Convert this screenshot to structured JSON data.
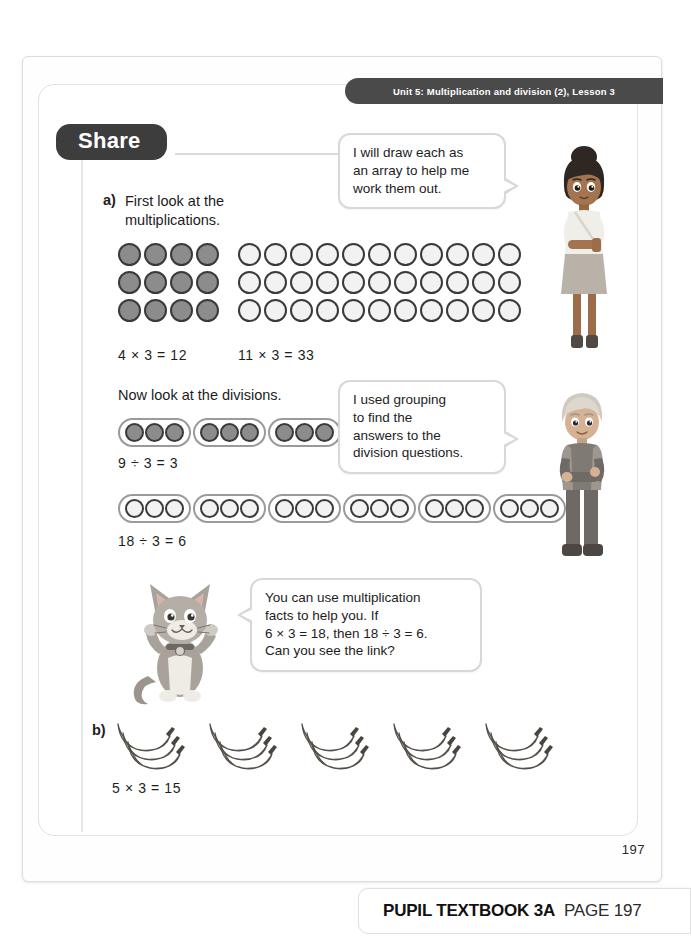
{
  "page": {
    "unit_banner": "Unit 5: Multiplication and division (2), Lesson 3",
    "section_badge": "Share",
    "page_number": "197",
    "footer_book": "PUPIL TEXTBOOK 3A",
    "footer_page": "PAGE 197"
  },
  "colors": {
    "banner_bg": "#4a4a4a",
    "badge_bg": "#3d3d3d",
    "counter_dark": "#8c8c8c",
    "counter_light": "#f2f2f2",
    "counter_outline": "#3a3a3a",
    "frame": "#e2e2e2"
  },
  "part_a": {
    "label": "a)",
    "instruction_line1": "First look at the",
    "instruction_line2": "multiplications.",
    "division_instruction": "Now look at the divisions.",
    "arrays": [
      {
        "name": "four-by-three-array",
        "columns": 4,
        "rows": 3,
        "fill": "dark",
        "equation": "4 × 3 = 12"
      },
      {
        "name": "eleven-by-three-array",
        "columns": 11,
        "rows": 3,
        "fill": "light",
        "equation": "11 × 3 = 33"
      }
    ],
    "groupings": [
      {
        "name": "nine-divided-by-three",
        "groups": 3,
        "per_group": 3,
        "fill": "dark",
        "equation": "9 ÷ 3 = 3"
      },
      {
        "name": "eighteen-divided-by-three",
        "groups": 6,
        "per_group": 3,
        "fill": "light",
        "equation": "18 ÷ 3 = 6"
      }
    ]
  },
  "part_b": {
    "label": "b)",
    "bunch_count": 5,
    "bananas_per_bunch": 3,
    "equation": "5 × 3 = 15"
  },
  "bubbles": [
    {
      "name": "girl-speech-bubble",
      "speaker": "girl",
      "lines": [
        "I will draw each as",
        "an array to help me",
        "work them out."
      ]
    },
    {
      "name": "boy-speech-bubble",
      "speaker": "boy",
      "lines": [
        "I used grouping",
        "to find the",
        "answers to the",
        "division questions."
      ]
    },
    {
      "name": "cat-speech-bubble",
      "speaker": "cat",
      "lines": [
        "You can use multiplication",
        "facts to help you. If",
        "6 × 3 = 18, then 18 ÷ 3 = 6.",
        "Can you see the link?"
      ]
    }
  ],
  "characters": [
    {
      "name": "girl-character",
      "description": "girl-illustration"
    },
    {
      "name": "boy-character",
      "description": "boy-illustration"
    },
    {
      "name": "cat-character",
      "description": "cat-mascot-illustration"
    }
  ]
}
